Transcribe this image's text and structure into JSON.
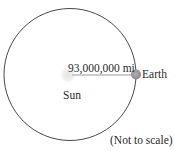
{
  "diagram": {
    "distance_label": "93,000,000 mi",
    "earth_label": "Earth",
    "sun_label": "Sun",
    "note": "(Not to scale)",
    "colors": {
      "orbit": "#333333",
      "radius_line": "#bdbdbd",
      "earth": "#9a9a9a",
      "sun_glow": "#e6e6e6"
    }
  }
}
